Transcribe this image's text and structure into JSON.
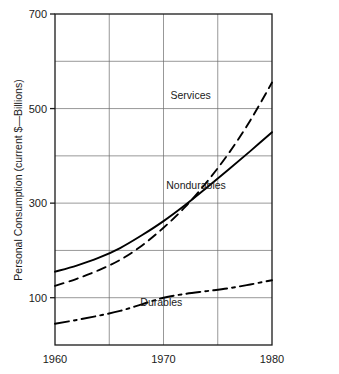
{
  "chart_data": {
    "type": "line",
    "title": "",
    "xlabel": "",
    "ylabel": "Personal Consumption (current $—Billions)",
    "xlim": [
      1960,
      1980
    ],
    "ylim": [
      0,
      700
    ],
    "grid": true,
    "legend_position": "inline-annotations",
    "x_ticks": [
      "1960",
      "1970",
      "1980"
    ],
    "x_tick_values": [
      1960,
      1970,
      1980
    ],
    "y_ticks": [
      "100",
      "300",
      "500",
      "700"
    ],
    "y_tick_values": [
      100,
      300,
      500,
      700
    ],
    "x": [
      1960,
      1962,
      1964,
      1966,
      1968,
      1970,
      1972,
      1974,
      1976,
      1978,
      1980
    ],
    "series": [
      {
        "name": "Services",
        "line_style": "dashed",
        "label": "Services",
        "values": [
          125,
          140,
          158,
          180,
          210,
          248,
          292,
          345,
          405,
          475,
          555
        ]
      },
      {
        "name": "Nondurables",
        "line_style": "solid",
        "label": "Nondurables",
        "values": [
          155,
          168,
          184,
          205,
          232,
          262,
          296,
          333,
          371,
          410,
          450
        ]
      },
      {
        "name": "Durables",
        "line_style": "dash-dot",
        "label": "Durables",
        "values": [
          45,
          53,
          62,
          72,
          86,
          100,
          108,
          114,
          120,
          128,
          137
        ]
      }
    ],
    "annotations": [
      {
        "text": "Services",
        "x": 1972.5,
        "y": 520
      },
      {
        "text": "Nondurables",
        "x": 1973.0,
        "y": 330
      },
      {
        "text": "Durables",
        "x": 1969.8,
        "y": 82
      }
    ],
    "colors": {
      "series_stroke": "#000000",
      "grid": "#6b6b6b",
      "frame": "#1a1a1a",
      "background": "#ffffff",
      "text": "#1a1a1a"
    }
  }
}
